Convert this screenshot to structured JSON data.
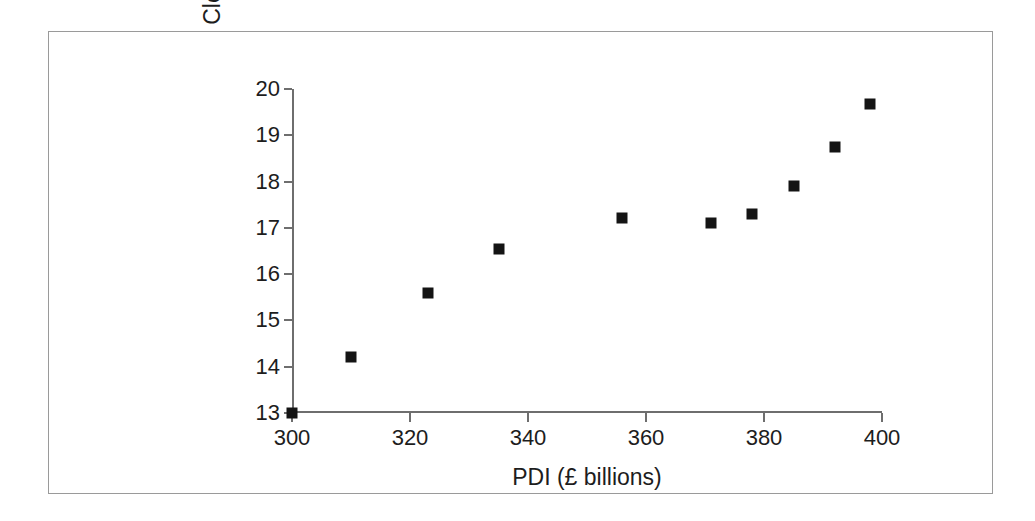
{
  "figure": {
    "background_color": "#ffffff",
    "frame_color": "#9a9a9a",
    "axis_color": "#6e6e6e",
    "marker_color": "#141414"
  },
  "chart_data": {
    "type": "scatter",
    "title": "",
    "xlabel": "PDI (£ billions)",
    "ylabel": "Clothing (£ billions)",
    "xlim": [
      300,
      400
    ],
    "ylim": [
      13,
      20
    ],
    "xticks": [
      300,
      320,
      340,
      360,
      380,
      400
    ],
    "yticks": [
      13,
      14,
      15,
      16,
      17,
      18,
      19,
      20
    ],
    "xtick_labels": [
      "300",
      "320",
      "340",
      "360",
      "380",
      "400"
    ],
    "ytick_labels": [
      "13",
      "14",
      "15",
      "16",
      "17",
      "18",
      "19",
      "20"
    ],
    "grid": false,
    "legend": null,
    "marker_shape": "square",
    "series": [
      {
        "name": "Clothing vs PDI",
        "points": [
          {
            "x": 300,
            "y": 13.0
          },
          {
            "x": 310,
            "y": 14.2
          },
          {
            "x": 323,
            "y": 15.6
          },
          {
            "x": 335,
            "y": 16.55
          },
          {
            "x": 356,
            "y": 17.22
          },
          {
            "x": 371,
            "y": 17.1
          },
          {
            "x": 378,
            "y": 17.3
          },
          {
            "x": 385,
            "y": 17.9
          },
          {
            "x": 392,
            "y": 18.75
          },
          {
            "x": 398,
            "y": 19.68
          }
        ]
      }
    ]
  }
}
